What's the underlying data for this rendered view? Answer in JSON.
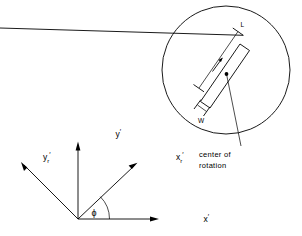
{
  "figure": {
    "background_color": "#ffffff",
    "line_color": "#000000"
  },
  "axes": {
    "origin_label": "",
    "items": [
      {
        "id": "x-prime",
        "base": "x",
        "subscript": "",
        "prime": "′",
        "description": "horizontal reference axis"
      },
      {
        "id": "y-prime",
        "base": "y",
        "subscript": "",
        "prime": "′",
        "description": "vertical reference axis"
      },
      {
        "id": "x-rotated-prime",
        "base": "x",
        "subscript": "r",
        "prime": "′",
        "description": "rotated axis in first quadrant"
      },
      {
        "id": "y-rotated-prime",
        "base": "y",
        "subscript": "r",
        "prime": "′",
        "description": "rotated axis in second quadrant"
      }
    ],
    "angle": {
      "symbol": "ϕ",
      "name": "phi",
      "description": "angle between x-prime axis and rotated x-prime-r axis"
    }
  },
  "detail_view": {
    "shape": "circle",
    "contents": {
      "element": "rectangle",
      "orientation": "rotated",
      "dimensions": [
        {
          "id": "length",
          "label": "L"
        },
        {
          "id": "width",
          "label": "W"
        }
      ],
      "marker": {
        "id": "center-of-rotation",
        "type": "dot"
      }
    },
    "callout": {
      "line1": "center of",
      "line2": "rotation"
    }
  }
}
